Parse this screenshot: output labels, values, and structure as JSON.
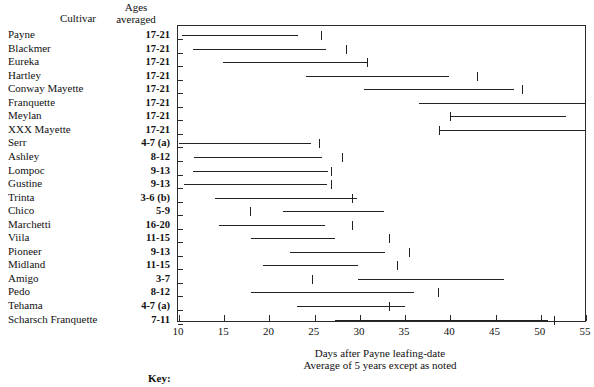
{
  "header": {
    "cultivar_label": "Cultivar",
    "ages_label": "Ages\naveraged",
    "ages_line1": "Ages",
    "ages_line2": "averaged"
  },
  "captions": {
    "xlabel_line1": "Days after Payne leafing-date",
    "xlabel_line2": "Average of 5 years except as noted",
    "key_label": "Key:"
  },
  "chart_data": {
    "type": "bar",
    "title": "",
    "subtitle": "",
    "xlabel": "Days after Payne leafing-date",
    "xlabel2": "Average of 5 years except as noted",
    "ylabel": "Cultivar",
    "xlim": [
      10,
      55
    ],
    "xticks": [
      10,
      15,
      20,
      25,
      30,
      35,
      40,
      45,
      50,
      55
    ],
    "grid": false,
    "legend": "none",
    "orientation": "horizontal-range",
    "value_units": "days after Payne leafing-date",
    "columns": [
      "Cultivar",
      "Ages averaged",
      "Range start",
      "Range end",
      "Mark"
    ],
    "categories": [
      "Payne",
      "Blackmer",
      "Eureka",
      "Hartley",
      "Conway Mayette",
      "Franquette",
      "Meylan",
      "XXX Mayette",
      "Serr",
      "Ashley",
      "Lompoc",
      "Gustine",
      "Trinta",
      "Chico",
      "Marchetti",
      "Villa",
      "Pioneer",
      "Midland",
      "Amigo",
      "Pedo",
      "Tehama",
      "Scharsch Franquette"
    ],
    "rows": [
      {
        "cultivar": "Payne",
        "ages": "17-21",
        "start": 10.3,
        "end": 23.2,
        "mark": 25.7
      },
      {
        "cultivar": "Blackmer",
        "ages": "17-21",
        "start": 11.6,
        "end": 26.2,
        "mark": 28.5
      },
      {
        "cultivar": "Eureka",
        "ages": "17-21",
        "start": 14.9,
        "end": 30.8,
        "mark": 30.8
      },
      {
        "cultivar": "Hartley",
        "ages": "17-21",
        "start": 24.0,
        "end": 39.9,
        "mark": 42.9
      },
      {
        "cultivar": "Conway Mayette",
        "ages": "17-21",
        "start": 30.5,
        "end": 47.0,
        "mark": 47.9
      },
      {
        "cultivar": "Franquette",
        "ages": "17-21",
        "start": 36.5,
        "end": 54.9,
        "mark": 54.9
      },
      {
        "cultivar": "Meylan",
        "ages": "17-21",
        "start": 40.0,
        "end": 52.8,
        "mark": 40.0
      },
      {
        "cultivar": "XXX Mayette",
        "ages": "17-21",
        "start": 38.7,
        "end": 54.9,
        "mark": 38.7
      },
      {
        "cultivar": "Serr",
        "ages": "4-7 (a)",
        "start": 10.0,
        "end": 24.6,
        "mark": 25.5
      },
      {
        "cultivar": "Ashley",
        "ages": "8-12",
        "start": 11.7,
        "end": 25.8,
        "mark": 28.0
      },
      {
        "cultivar": "Lompoc",
        "ages": "9-13",
        "start": 11.5,
        "end": 26.5,
        "mark": 26.8
      },
      {
        "cultivar": "Gustine",
        "ages": "9-13",
        "start": 10.5,
        "end": 26.4,
        "mark": 26.8
      },
      {
        "cultivar": "Trinta",
        "ages": "3-6 (b)",
        "start": 14.0,
        "end": 29.7,
        "mark": 29.1
      },
      {
        "cultivar": "Chico",
        "ages": "5-9",
        "start": 21.5,
        "end": 32.7,
        "mark": 17.8
      },
      {
        "cultivar": "Marchetti",
        "ages": "16-20",
        "start": 14.4,
        "end": 26.1,
        "mark": 29.1
      },
      {
        "cultivar": "Viila",
        "ages": "11-15",
        "start": 18.0,
        "end": 27.2,
        "mark": 33.2
      },
      {
        "cultivar": "Pioneer",
        "ages": "9-13",
        "start": 22.3,
        "end": 32.8,
        "mark": 35.4
      },
      {
        "cultivar": "Midland",
        "ages": "11-15",
        "start": 19.3,
        "end": 29.8,
        "mark": 34.1
      },
      {
        "cultivar": "Amigo",
        "ages": "3-7",
        "start": 29.8,
        "end": 45.9,
        "mark": 24.7
      },
      {
        "cultivar": "Pedo",
        "ages": "8-12",
        "start": 18.0,
        "end": 36.0,
        "mark": 38.6
      },
      {
        "cultivar": "Tehama",
        "ages": "4-7 (a)",
        "start": 23.1,
        "end": 35.0,
        "mark": 33.2
      },
      {
        "cultivar": "Scharsch Franquette",
        "ages": "7-11",
        "start": 27.3,
        "end": 50.8,
        "mark": 51.5
      }
    ]
  }
}
